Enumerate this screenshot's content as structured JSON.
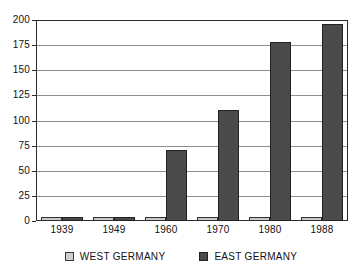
{
  "chart_data": {
    "type": "bar",
    "title": "",
    "subtitle": "",
    "xlabel": "",
    "ylabel": "",
    "categories": [
      "1939",
      "1949",
      "1960",
      "1970",
      "1980",
      "1988"
    ],
    "series": [
      {
        "name": "WEST GERMANY",
        "color": "#c8c8c8",
        "values": [
          4,
          4,
          4,
          4,
          4,
          4
        ]
      },
      {
        "name": "EAST GERMANY",
        "color": "#4a4a4a",
        "values": [
          4,
          4,
          71,
          110,
          178,
          196
        ]
      }
    ],
    "ylim": [
      0,
      200
    ],
    "yticks": [
      0,
      25,
      50,
      75,
      100,
      125,
      150,
      175,
      200
    ],
    "ytick_labels": [
      "0",
      "25",
      "50",
      "75",
      "100",
      "125",
      "150",
      "175",
      "200"
    ],
    "grid": true,
    "grid_axis": "y",
    "legend_position": "bottom",
    "legend": [
      {
        "label": "WEST GERMANY",
        "swatch": "light-gray-square"
      },
      {
        "label": "EAST GERMANY",
        "swatch": "dark-gray-square"
      }
    ],
    "frame_color": "#2a2a2a",
    "gridline_color": "#8f8f8f",
    "background_color": "#ffffff"
  }
}
